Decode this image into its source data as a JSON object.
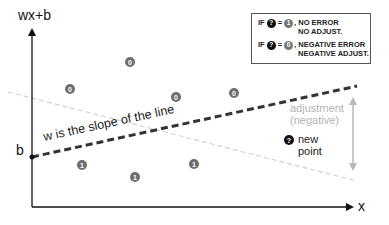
{
  "diagram": {
    "y_axis_label": "wx+b",
    "x_axis_label": "x",
    "intercept_label": "b",
    "slope_label": "w is the slope of the line",
    "adjustment_label": [
      "adjustment",
      "(negative)"
    ],
    "new_point_label": [
      "new",
      "point"
    ],
    "new_point_symbol": "?",
    "legend": {
      "rows": [
        {
          "prefix": "IF",
          "symbol": "?",
          "equals": "=",
          "value": "1",
          "lines": [
            ", NO ERROR",
            "NO ADJUST."
          ]
        },
        {
          "prefix": "IF",
          "symbol": "?",
          "equals": "=",
          "value": "0",
          "lines": [
            ", NEGATIVE ERROR",
            "NEGATIVE ADJUST."
          ]
        }
      ]
    },
    "points_class_0": [
      {
        "label": "0",
        "x": 130,
        "y": 62
      },
      {
        "label": "0",
        "x": 70,
        "y": 89
      },
      {
        "label": "0",
        "x": 176,
        "y": 97
      },
      {
        "label": "0",
        "x": 234,
        "y": 93
      }
    ],
    "points_class_1": [
      {
        "label": "1",
        "x": 82,
        "y": 165
      },
      {
        "label": "1",
        "x": 135,
        "y": 177
      },
      {
        "label": "1",
        "x": 194,
        "y": 164
      }
    ],
    "colors": {
      "axis": "#111111",
      "decision_line": "#333333",
      "adjusted_line": "#d0d0d0",
      "adjustment_arrow": "#b8b8b8",
      "point_fill": "#6e6e6e",
      "new_point_fill": "#111111"
    }
  }
}
